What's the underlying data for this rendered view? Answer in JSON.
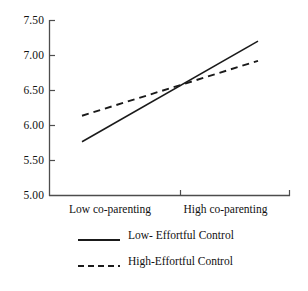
{
  "chart_data": {
    "type": "line",
    "title": "",
    "xlabel": "",
    "ylabel": "",
    "categories": [
      "Low co-parenting",
      "High co-parenting"
    ],
    "x": [
      0,
      1
    ],
    "xlim": [
      0,
      1
    ],
    "ylim": [
      5.0,
      7.5
    ],
    "y_ticks": [
      "5.00",
      "5.50",
      "6.00",
      "6.50",
      "7.00",
      "7.50"
    ],
    "y_tick_values": [
      5.0,
      5.5,
      6.0,
      6.5,
      7.0,
      7.5
    ],
    "grid": false,
    "legend_position": "bottom",
    "series": [
      {
        "name": "Low- Effortful Control",
        "style": "solid",
        "color": "#1a1a1a",
        "values": [
          5.77,
          7.2
        ]
      },
      {
        "name": "High-Effortful Control",
        "style": "dashed",
        "color": "#1a1a1a",
        "values": [
          6.14,
          6.92
        ]
      }
    ],
    "intersection": {
      "x": 0.62,
      "y": 6.63
    }
  },
  "axes": {
    "y_tick_labels": [
      "7.50",
      "7.00",
      "6.50",
      "6.00",
      "5.50",
      "5.00"
    ],
    "x_tick_labels": [
      "Low co-parenting",
      "High co-parenting"
    ]
  },
  "legend": {
    "items": [
      {
        "label": "Low- Effortful Control",
        "style": "solid"
      },
      {
        "label": "High-Effortful Control",
        "style": "dashed"
      }
    ]
  },
  "colors": {
    "axis": "#4d4d4d",
    "series": "#1a1a1a",
    "background": "#ffffff"
  }
}
